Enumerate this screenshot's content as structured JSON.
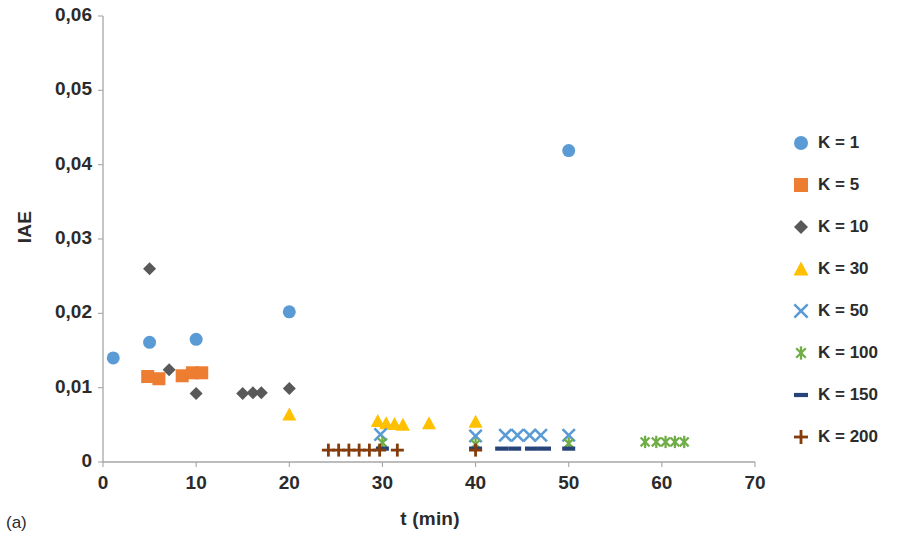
{
  "panel_label": "(a)",
  "chart_data": {
    "type": "scatter",
    "title": "",
    "xlabel": "t (min)",
    "ylabel": "IAE",
    "xlim": [
      0,
      70
    ],
    "ylim": [
      0,
      0.06
    ],
    "xticks": [
      0,
      10,
      20,
      30,
      40,
      50,
      60,
      70
    ],
    "xtick_labels": [
      "0",
      "10",
      "20",
      "30",
      "40",
      "50",
      "60",
      "70"
    ],
    "yticks": [
      0,
      0.01,
      0.02,
      0.03,
      0.04,
      0.05,
      0.06
    ],
    "ytick_labels": [
      "0",
      "0,01",
      "0,02",
      "0,03",
      "0,04",
      "0,05",
      "0,06"
    ],
    "grid": false,
    "legend_position": "right",
    "series": [
      {
        "name": "K = 1",
        "legend_label": "K = 1",
        "marker": "circle",
        "color": "#5b9bd5",
        "size": 13,
        "points": [
          {
            "x": 1.1,
            "y": 0.014
          },
          {
            "x": 5.0,
            "y": 0.0161
          },
          {
            "x": 10.0,
            "y": 0.0165
          },
          {
            "x": 20.0,
            "y": 0.0202
          },
          {
            "x": 50.0,
            "y": 0.0419
          }
        ]
      },
      {
        "name": "K = 5",
        "legend_label": "K = 5",
        "marker": "square",
        "color": "#ed7d31",
        "size": 13,
        "points": [
          {
            "x": 4.8,
            "y": 0.0115
          },
          {
            "x": 6.0,
            "y": 0.0112
          },
          {
            "x": 8.5,
            "y": 0.0116
          },
          {
            "x": 9.6,
            "y": 0.012
          },
          {
            "x": 10.6,
            "y": 0.012
          }
        ]
      },
      {
        "name": "K = 10",
        "legend_label": "K = 10",
        "marker": "diamond",
        "color": "#595959",
        "size": 13,
        "points": [
          {
            "x": 5.0,
            "y": 0.026
          },
          {
            "x": 7.1,
            "y": 0.0124
          },
          {
            "x": 10.0,
            "y": 0.0092
          },
          {
            "x": 15.0,
            "y": 0.0092
          },
          {
            "x": 16.1,
            "y": 0.0093
          },
          {
            "x": 17.0,
            "y": 0.0093
          },
          {
            "x": 20.0,
            "y": 0.0099
          }
        ]
      },
      {
        "name": "K = 30",
        "legend_label": "K = 30",
        "marker": "triangle",
        "color": "#ffc000",
        "size": 14,
        "points": [
          {
            "x": 20.0,
            "y": 0.0064
          },
          {
            "x": 29.5,
            "y": 0.0055
          },
          {
            "x": 30.4,
            "y": 0.0052
          },
          {
            "x": 31.3,
            "y": 0.0051
          },
          {
            "x": 32.2,
            "y": 0.005
          },
          {
            "x": 35.0,
            "y": 0.0052
          },
          {
            "x": 40.0,
            "y": 0.0054
          }
        ]
      },
      {
        "name": "K = 50",
        "legend_label": "K = 50",
        "marker": "x",
        "color": "#5b9bd5",
        "size": 13,
        "points": [
          {
            "x": 29.8,
            "y": 0.0037
          },
          {
            "x": 40.0,
            "y": 0.0035
          },
          {
            "x": 43.2,
            "y": 0.0036
          },
          {
            "x": 44.5,
            "y": 0.0036
          },
          {
            "x": 45.8,
            "y": 0.0036
          },
          {
            "x": 47.0,
            "y": 0.0036
          },
          {
            "x": 50.0,
            "y": 0.0036
          }
        ]
      },
      {
        "name": "K = 100",
        "legend_label": "K = 100",
        "marker": "asterisk",
        "color": "#70ad47",
        "size": 13,
        "points": [
          {
            "x": 30.0,
            "y": 0.0026
          },
          {
            "x": 40.0,
            "y": 0.0024
          },
          {
            "x": 50.0,
            "y": 0.0025
          },
          {
            "x": 58.2,
            "y": 0.0027
          },
          {
            "x": 59.4,
            "y": 0.0027
          },
          {
            "x": 60.4,
            "y": 0.0027
          },
          {
            "x": 61.4,
            "y": 0.0027
          },
          {
            "x": 62.4,
            "y": 0.0027
          }
        ]
      },
      {
        "name": "K = 150",
        "legend_label": "K = 150",
        "marker": "dash",
        "color": "#264478",
        "size": 13,
        "points": [
          {
            "x": 30.0,
            "y": 0.0018
          },
          {
            "x": 40.0,
            "y": 0.0018
          },
          {
            "x": 42.8,
            "y": 0.0018
          },
          {
            "x": 44.2,
            "y": 0.0018
          },
          {
            "x": 46.0,
            "y": 0.0018
          },
          {
            "x": 47.4,
            "y": 0.0018
          },
          {
            "x": 50.0,
            "y": 0.0018
          }
        ]
      },
      {
        "name": "K = 200",
        "legend_label": "K = 200",
        "marker": "plus",
        "color": "#843c0c",
        "size": 13,
        "points": [
          {
            "x": 24.2,
            "y": 0.0016
          },
          {
            "x": 25.3,
            "y": 0.0016
          },
          {
            "x": 26.4,
            "y": 0.0016
          },
          {
            "x": 27.5,
            "y": 0.0016
          },
          {
            "x": 28.6,
            "y": 0.0016
          },
          {
            "x": 29.7,
            "y": 0.0016
          },
          {
            "x": 31.6,
            "y": 0.0016
          },
          {
            "x": 40.0,
            "y": 0.0016
          }
        ]
      }
    ]
  }
}
